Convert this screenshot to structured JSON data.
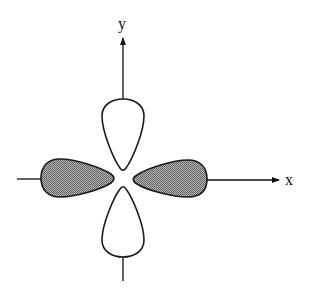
{
  "diagram": {
    "type": "d-orbital lobes (dx2-y2)",
    "axes": {
      "x_label": "x",
      "y_label": "y"
    },
    "lobes": [
      {
        "position": "top",
        "fill": "white",
        "shaded": false
      },
      {
        "position": "bottom",
        "fill": "white",
        "shaded": false
      },
      {
        "position": "left",
        "fill": "stippled-gray",
        "shaded": true
      },
      {
        "position": "right",
        "fill": "stippled-gray",
        "shaded": true
      }
    ],
    "colors": {
      "stroke": "#1a1a1a",
      "shaded_fill": "#8c8c8c",
      "unshaded_fill": "#ffffff",
      "background": "#ffffff"
    }
  }
}
